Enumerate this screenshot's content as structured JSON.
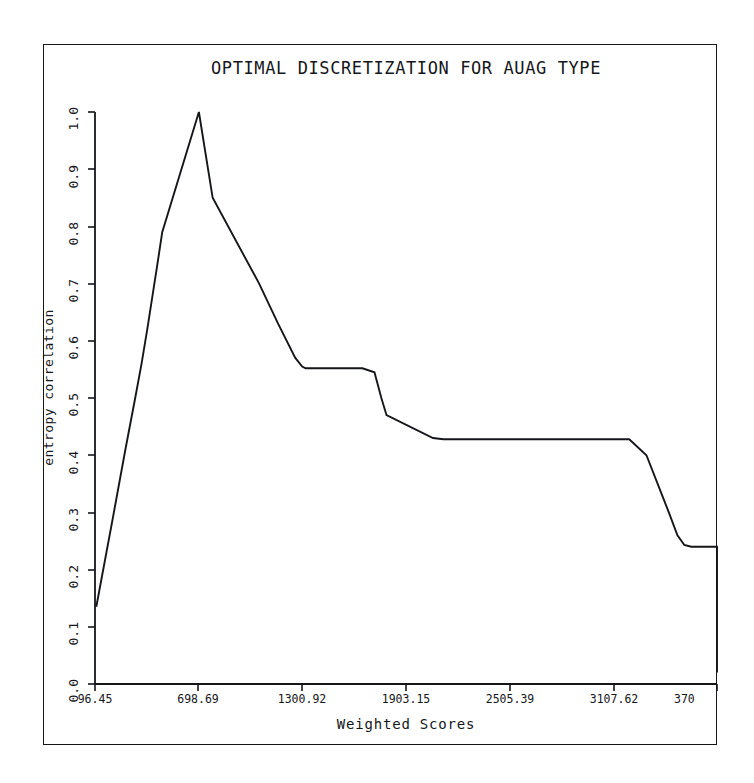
{
  "figure": {
    "background_color": "#ffffff",
    "ink_color": "#15161a",
    "frame_border": true
  },
  "chart_data": {
    "type": "line",
    "title": "OPTIMAL DISCRETIZATION FOR AUAG TYPE",
    "xlabel": "Weighted Scores",
    "ylabel": "entropy correlation",
    "grid": false,
    "legend": null,
    "xlim": [
      96.45,
      3709.86
    ],
    "ylim": [
      0.0,
      1.0
    ],
    "xticks": [
      96.45,
      698.69,
      1300.92,
      1903.15,
      2505.39,
      3107.62,
      3709.86
    ],
    "xtick_labels": [
      "96.45",
      "698.69",
      "1300.92",
      "1903.15",
      "2505.39",
      "3107.62",
      "370"
    ],
    "yticks": [
      0.0,
      0.1,
      0.2,
      0.3,
      0.4,
      0.5,
      0.6,
      0.7,
      0.8,
      0.9,
      1.0
    ],
    "ytick_labels": [
      "0.0",
      "0.1",
      "0.2",
      "0.3",
      "0.4",
      "0.5",
      "0.6",
      "0.7",
      "0.8",
      "0.9",
      "1.0"
    ],
    "series": [
      {
        "name": "entropy correlation",
        "color": "#15161a",
        "x": [
          104,
          200,
          273,
          330,
          367,
          400,
          457,
          487,
          700,
          780,
          1050,
          1160,
          1260,
          1300,
          1320,
          1650,
          1720,
          1760,
          1790,
          2060,
          2120,
          2280,
          2500,
          2800,
          3100,
          3200,
          3300,
          3430,
          3480,
          3520,
          3560,
          3640,
          3700,
          3710
        ],
        "y": [
          0.135,
          0.29,
          0.41,
          0.5,
          0.56,
          0.62,
          0.73,
          0.79,
          1.0,
          0.85,
          0.7,
          0.63,
          0.57,
          0.555,
          0.552,
          0.552,
          0.545,
          0.5,
          0.47,
          0.43,
          0.428,
          0.428,
          0.428,
          0.428,
          0.428,
          0.428,
          0.4,
          0.3,
          0.26,
          0.243,
          0.24,
          0.24,
          0.24,
          0.24
        ],
        "note": "piecewise-linear monotone decreasing staircase after the single peak at 1.00"
      }
    ],
    "curve_pixel_path": "97,607 160,112 228,366 248,366 305,437 430,437 450,437 480,437 530,548 612,548 625,548 635,596 695,596 717,672",
    "annotations": []
  },
  "axis_geometry": {
    "plot_left_px": 95,
    "plot_right_px": 717,
    "plot_top_px": 112,
    "plot_bottom_px": 684
  }
}
